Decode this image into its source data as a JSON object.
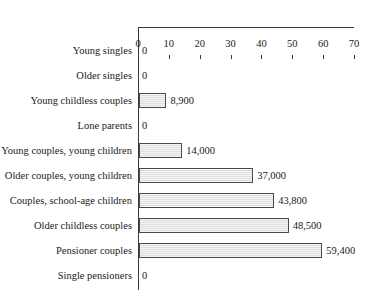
{
  "chart_data": {
    "type": "bar",
    "orientation": "horizontal",
    "title": "",
    "subtitle": "",
    "xlabel": "",
    "ylabel": "",
    "xlim": [
      0,
      70
    ],
    "grid": false,
    "legend": false,
    "axis_ticks": [
      {
        "value": 0,
        "label": "0"
      },
      {
        "value": 10,
        "label": "10"
      },
      {
        "value": 20,
        "label": "20"
      },
      {
        "value": 30,
        "label": "30"
      },
      {
        "value": 40,
        "label": "40"
      },
      {
        "value": 50,
        "label": "50"
      },
      {
        "value": 60,
        "label": "60"
      },
      {
        "value": 70,
        "label": "70"
      }
    ],
    "categories": [
      "Young singles",
      "Older singles",
      "Young childless couples",
      "Lone parents",
      "Young couples, young children",
      "Older couples, young children",
      "Couples, school-age children",
      "Older childless couples",
      "Pensioner couples",
      "Single pensioners"
    ],
    "values": [
      0,
      0,
      8.9,
      0,
      14.0,
      37.0,
      43.8,
      48.5,
      59.4,
      0
    ],
    "data_labels": [
      "0",
      "0",
      "8,900",
      "0",
      "14,000",
      "37,000",
      "43,800",
      "48,500",
      "59,400",
      "0"
    ],
    "rows": [
      {
        "category": "Young singles",
        "value": 0,
        "label": "0"
      },
      {
        "category": "Older singles",
        "value": 0,
        "label": "0"
      },
      {
        "category": "Young childless couples",
        "value": 8.9,
        "label": "8,900"
      },
      {
        "category": "Lone parents",
        "value": 0,
        "label": "0"
      },
      {
        "category": "Young couples, young children",
        "value": 14.0,
        "label": "14,000"
      },
      {
        "category": "Older couples, young children",
        "value": 37.0,
        "label": "37,000"
      },
      {
        "category": "Couples, school-age children",
        "value": 43.8,
        "label": "43,800"
      },
      {
        "category": "Older childless couples",
        "value": 48.5,
        "label": "48,500"
      },
      {
        "category": "Pensioner couples",
        "value": 59.4,
        "label": "59,400"
      },
      {
        "category": "Single pensioners",
        "value": 0,
        "label": "0"
      }
    ],
    "colors": {
      "bar_fill": "#e7e7e7",
      "bar_border": "#4a4a4a",
      "axis": "#3a3a3a",
      "text": "#1a1a1a",
      "background": "#ffffff"
    }
  }
}
